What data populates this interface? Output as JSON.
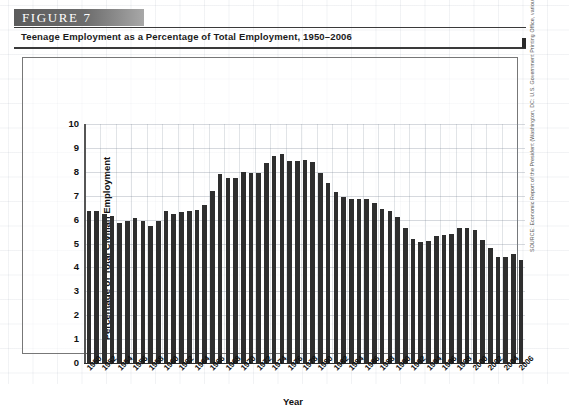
{
  "figure": {
    "banner_label": "FIGURE 7",
    "subtitle": "Teenage Employment as a Percentage of Total Employment, 1950–2006"
  },
  "source": {
    "text": "SOURCE: Economic Report of the President (Washington, DC: U.S. Government Printing Office, various years)."
  },
  "chart_data": {
    "type": "bar",
    "title": "Teenage Employment as a Percentage of Total Employment, 1950–2006",
    "xlabel": "Year",
    "ylabel": "Percentage of Total Civilian Employment",
    "ylim": [
      0,
      10
    ],
    "ytick_labels": [
      "0",
      "1",
      "2",
      "3",
      "4",
      "5",
      "6",
      "7",
      "8",
      "9",
      "10"
    ],
    "yticks": [
      0,
      1,
      2,
      3,
      4,
      5,
      6,
      7,
      8,
      9,
      10
    ],
    "grid": true,
    "legend": "none",
    "bar_color": "#2e2e2e",
    "x_tick_step_years": 2,
    "x_tick_labels": [
      "1950",
      "1952",
      "1954",
      "1956",
      "1958",
      "1960",
      "1962",
      "1964",
      "1966",
      "1968",
      "1970",
      "1972",
      "1974",
      "1976",
      "1978",
      "1980",
      "1982",
      "1984",
      "1986",
      "1988",
      "1990",
      "1992",
      "1994",
      "1996",
      "1998",
      "2000",
      "2002",
      "2004",
      "2006"
    ],
    "categories": [
      "1950",
      "1951",
      "1952",
      "1953",
      "1954",
      "1955",
      "1956",
      "1957",
      "1958",
      "1959",
      "1960",
      "1961",
      "1962",
      "1963",
      "1964",
      "1965",
      "1966",
      "1967",
      "1968",
      "1969",
      "1970",
      "1971",
      "1972",
      "1973",
      "1974",
      "1975",
      "1976",
      "1977",
      "1978",
      "1979",
      "1980",
      "1981",
      "1982",
      "1983",
      "1984",
      "1985",
      "1986",
      "1987",
      "1988",
      "1989",
      "1990",
      "1991",
      "1992",
      "1993",
      "1994",
      "1995",
      "1996",
      "1997",
      "1998",
      "1999",
      "2000",
      "2001",
      "2002",
      "2003",
      "2004",
      "2005",
      "2006"
    ],
    "values": [
      6.35,
      6.35,
      6.25,
      6.15,
      5.85,
      5.95,
      6.05,
      5.95,
      5.75,
      5.95,
      6.35,
      6.25,
      6.3,
      6.35,
      6.4,
      6.6,
      7.2,
      7.9,
      7.75,
      7.75,
      8.0,
      7.95,
      7.95,
      8.35,
      8.65,
      8.75,
      8.45,
      8.45,
      8.5,
      8.4,
      7.95,
      7.55,
      7.15,
      6.95,
      6.85,
      6.85,
      6.85,
      6.7,
      6.45,
      6.35,
      6.1,
      5.65,
      5.2,
      5.05,
      5.1,
      5.3,
      5.35,
      5.4,
      5.65,
      5.65,
      5.55,
      5.15,
      4.8,
      4.45,
      4.45,
      4.55,
      4.3
    ]
  }
}
